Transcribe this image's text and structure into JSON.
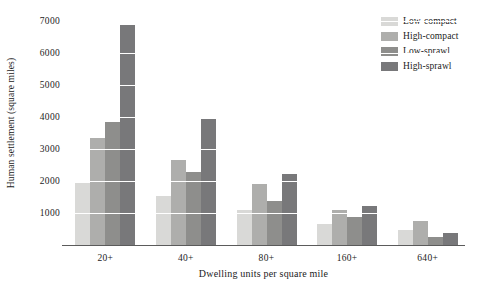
{
  "chart_data": {
    "type": "bar",
    "title": "",
    "xlabel": "Dwelling units per square mile",
    "ylabel": "Human settlement (square miles)",
    "categories": [
      "20+",
      "40+",
      "80+",
      "160+",
      "640+"
    ],
    "yticks": [
      1000,
      2000,
      3000,
      4000,
      5000,
      6000,
      7000
    ],
    "ylim": [
      0,
      7300
    ],
    "grid": "horizontal-white-gridlines",
    "legend_position": "top-right",
    "series": [
      {
        "name": "Low-compact",
        "color": "#d9d9d7",
        "values": [
          1950,
          1530,
          1100,
          670,
          480
        ]
      },
      {
        "name": "High-compact",
        "color": "#aeaeac",
        "values": [
          3350,
          2650,
          1900,
          1100,
          760
        ]
      },
      {
        "name": "Low-sprawl",
        "color": "#8e8e8c",
        "values": [
          3850,
          2280,
          1380,
          870,
          260
        ]
      },
      {
        "name": "High-sprawl",
        "color": "#78787a",
        "values": [
          6880,
          3930,
          2220,
          1220,
          360
        ]
      }
    ]
  },
  "axis": {
    "tick_label_1000": "1000",
    "tick_label_2000": "2000",
    "tick_label_3000": "3000",
    "tick_label_4000": "4000",
    "tick_label_5000": "5000",
    "tick_label_6000": "6000",
    "tick_label_7000": "7000"
  },
  "colors": {
    "axis_line": "#5b5b5b",
    "gridline": "#ffffff",
    "background": "#ffffff",
    "text": "#1c1c1c"
  }
}
